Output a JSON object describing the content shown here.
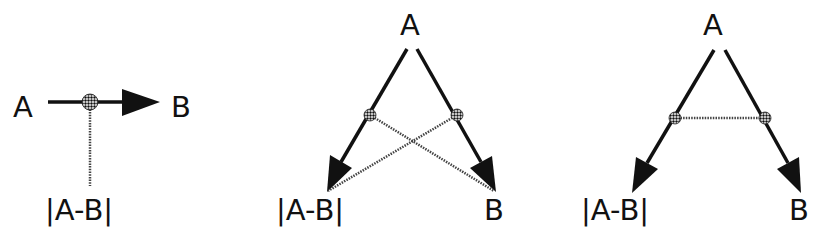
{
  "figure": {
    "panels": [
      {
        "id": "left",
        "labels": {
          "source": "A",
          "target": "B",
          "difference": "|A-B|"
        }
      },
      {
        "id": "middle",
        "labels": {
          "source": "A",
          "target_left": "|A-B|",
          "target_right": "B"
        }
      },
      {
        "id": "right",
        "labels": {
          "source": "A",
          "target_left": "|A-B|",
          "target_right": "B"
        }
      }
    ],
    "caption_fragment": ""
  },
  "colors": {
    "ink": "#111111",
    "dotted_line": "#444444",
    "background": "#ffffff"
  }
}
